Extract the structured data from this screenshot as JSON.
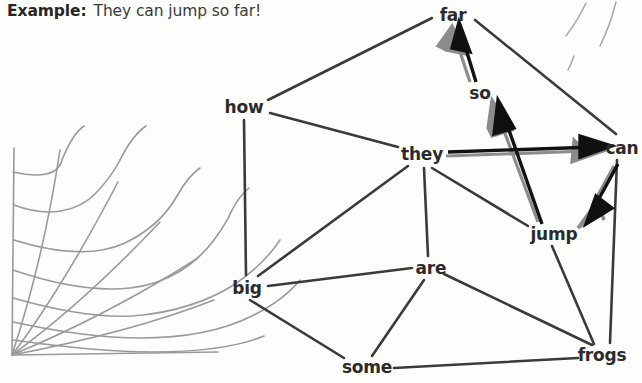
{
  "caption": {
    "lead": "Example:",
    "sentence": "They can jump so far!"
  },
  "graph": {
    "type": "word-graph",
    "nodes": [
      {
        "id": "far",
        "label": "far",
        "x": 453,
        "y": 15
      },
      {
        "id": "how",
        "label": "how",
        "x": 244,
        "y": 107
      },
      {
        "id": "so",
        "label": "so",
        "x": 480,
        "y": 93
      },
      {
        "id": "can",
        "label": "can",
        "x": 622,
        "y": 148
      },
      {
        "id": "they",
        "label": "they",
        "x": 422,
        "y": 154
      },
      {
        "id": "jump",
        "label": "jump",
        "x": 554,
        "y": 234
      },
      {
        "id": "are",
        "label": "are",
        "x": 431,
        "y": 268
      },
      {
        "id": "big",
        "label": "big",
        "x": 247,
        "y": 288
      },
      {
        "id": "some",
        "label": "some",
        "x": 367,
        "y": 367
      },
      {
        "id": "frogs",
        "label": "frogs",
        "x": 602,
        "y": 355
      }
    ],
    "edges": [
      {
        "from": "how",
        "to": "far",
        "directed": false
      },
      {
        "from": "how",
        "to": "they",
        "directed": false
      },
      {
        "from": "how",
        "to": "big",
        "directed": false
      },
      {
        "from": "far",
        "to": "can",
        "directed": false
      },
      {
        "from": "they",
        "to": "big",
        "directed": false
      },
      {
        "from": "they",
        "to": "are",
        "directed": false
      },
      {
        "from": "they",
        "to": "jump",
        "directed": false
      },
      {
        "from": "big",
        "to": "are",
        "directed": false
      },
      {
        "from": "big",
        "to": "some",
        "directed": false
      },
      {
        "from": "are",
        "to": "some",
        "directed": false
      },
      {
        "from": "are",
        "to": "frogs",
        "directed": false
      },
      {
        "from": "some",
        "to": "frogs",
        "directed": false
      },
      {
        "from": "jump",
        "to": "frogs",
        "directed": false
      },
      {
        "from": "can",
        "to": "frogs",
        "directed": false
      }
    ],
    "arrows": [
      {
        "from": "so",
        "to": "far",
        "directed": true
      },
      {
        "from": "they",
        "to": "can",
        "directed": true
      },
      {
        "from": "jump",
        "to": "so",
        "directed": true
      },
      {
        "from": "can",
        "to": "jump",
        "directed": true
      }
    ],
    "colors": {
      "edge": "#3a3a3a",
      "arrow_line": "#111111",
      "arrow_shadow": "#8c8c8c",
      "label": "#2b2b2b",
      "web": "#9a9a9a",
      "background": "#fdfdfc"
    }
  },
  "decorations": {
    "spider_web": "spider-web-corner-illustration",
    "top_right_strokes": "web-strand-strokes"
  }
}
